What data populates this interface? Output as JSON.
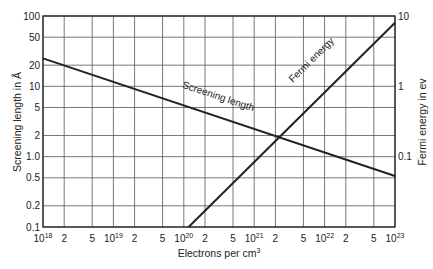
{
  "chart_data": {
    "type": "line",
    "title": "",
    "xlabel": "Electrons per cm",
    "xlabel_sup": "3",
    "ylabel_left": "Screening length in Å",
    "ylabel_right": "Fermi energy in ev",
    "x_scale": "log",
    "y_scale_left": "log",
    "y_scale_right": "log",
    "xlim": [
      1e+18,
      1e+23
    ],
    "ylim_left": [
      0.1,
      100
    ],
    "ylim_right": [
      0.01,
      10
    ],
    "grid": true,
    "legend": "none (inline line labels)",
    "x_ticks": [
      {
        "v": 1e+18,
        "label": "10",
        "sup": "18"
      },
      {
        "v": 2e+18,
        "label": "2",
        "sup": ""
      },
      {
        "v": 5e+18,
        "label": "5",
        "sup": ""
      },
      {
        "v": 1e+19,
        "label": "10",
        "sup": "19"
      },
      {
        "v": 2e+19,
        "label": "2",
        "sup": ""
      },
      {
        "v": 5e+19,
        "label": "5",
        "sup": ""
      },
      {
        "v": 1e+20,
        "label": "10",
        "sup": "20"
      },
      {
        "v": 2e+20,
        "label": "2",
        "sup": ""
      },
      {
        "v": 5e+20,
        "label": "5",
        "sup": ""
      },
      {
        "v": 1e+21,
        "label": "10",
        "sup": "21"
      },
      {
        "v": 2e+21,
        "label": "2",
        "sup": ""
      },
      {
        "v": 5e+21,
        "label": "5",
        "sup": ""
      },
      {
        "v": 1e+22,
        "label": "10",
        "sup": "22"
      },
      {
        "v": 2e+22,
        "label": "2",
        "sup": ""
      },
      {
        "v": 5e+22,
        "label": "5",
        "sup": ""
      },
      {
        "v": 1e+23,
        "label": "10",
        "sup": "23"
      }
    ],
    "y_ticks_left": [
      {
        "v": 0.1,
        "label": "0.1"
      },
      {
        "v": 0.2,
        "label": "0.2"
      },
      {
        "v": 0.5,
        "label": "0.5"
      },
      {
        "v": 1,
        "label": "1.0"
      },
      {
        "v": 2,
        "label": "2"
      },
      {
        "v": 5,
        "label": "5"
      },
      {
        "v": 10,
        "label": "10"
      },
      {
        "v": 20,
        "label": "20"
      },
      {
        "v": 50,
        "label": "50"
      },
      {
        "v": 100,
        "label": "100"
      }
    ],
    "y_ticks_right": [
      {
        "v": 0.1,
        "label": "0.1"
      },
      {
        "v": 1,
        "label": "1"
      },
      {
        "v": 10,
        "label": "10"
      }
    ],
    "series": [
      {
        "name": "Screening length",
        "axis": "left",
        "x": [
          1e+18,
          1e+23
        ],
        "y": [
          25,
          0.53
        ],
        "label_pos": {
          "x": 3e+20,
          "y": 6.5
        }
      },
      {
        "name": "Fermi energy",
        "axis": "right",
        "x": [
          1.17e+20,
          1e+23
        ],
        "y": [
          0.01,
          8
        ],
        "label_pos": {
          "x": 7e+21,
          "y": 2.2
        }
      }
    ]
  },
  "colors": {
    "line": "#222222",
    "grid": "#555555",
    "background": "#ffffff"
  }
}
